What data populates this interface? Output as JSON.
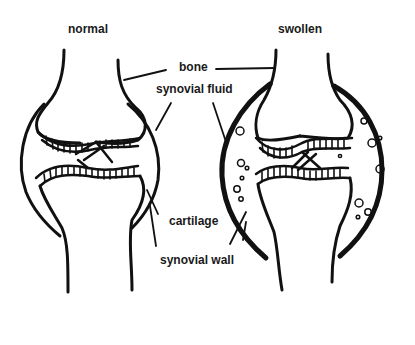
{
  "titles": {
    "normal": "normal",
    "swollen": "swollen"
  },
  "labels": {
    "bone": "bone",
    "synovial_fluid": "synovial fluid",
    "cartilage": "cartilage",
    "synovial_wall": "synovial wall"
  },
  "colors": {
    "ink": "#111111",
    "background": "#ffffff"
  }
}
